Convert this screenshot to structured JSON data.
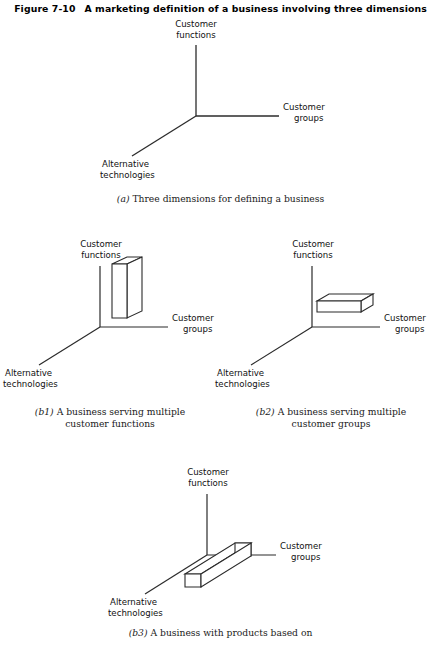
{
  "figure": {
    "number": "Figure 7-10",
    "title": "A marketing definition of a business involving three dimensions"
  },
  "axis_labels": {
    "functions_line1": "Customer",
    "functions_line2": "functions",
    "groups_line1": "Customer",
    "groups_line2": "groups",
    "technologies_line1": "Alternative",
    "technologies_line2": "technologies"
  },
  "panels": {
    "a": {
      "caption_tag": "(a)",
      "caption_line1": "Three dimensions for defining a business",
      "caption_line2": "",
      "box": "none"
    },
    "b1": {
      "caption_tag": "(b1)",
      "caption_line1": "A business serving multiple",
      "caption_line2": "customer functions",
      "box": "vertical-bar"
    },
    "b2": {
      "caption_tag": "(b2)",
      "caption_line1": "A business serving multiple",
      "caption_line2": "customer groups",
      "box": "horizontal-slab"
    },
    "b3": {
      "caption_tag": "(b3)",
      "caption_line1": "A business with products based on",
      "caption_line2": "",
      "box": "depth-bar"
    }
  },
  "colors": {
    "ink": "#1a1a1a",
    "line": "#2b2b2b",
    "background": "#ffffff"
  }
}
